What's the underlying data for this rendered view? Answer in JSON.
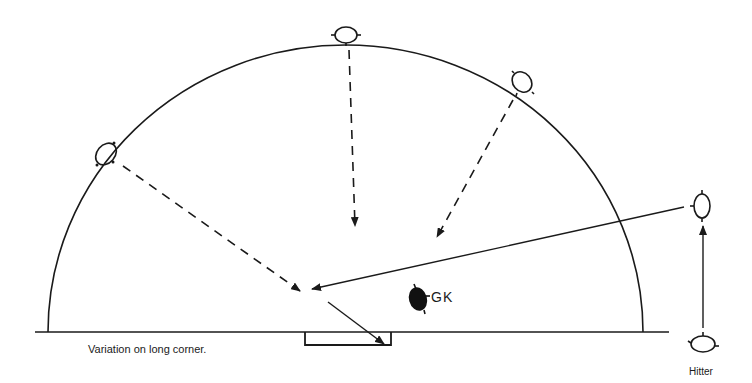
{
  "diagram": {
    "caption": "Variation on long corner.",
    "labels": {
      "goalkeeper": "GK",
      "hitter": "Hitter"
    },
    "colors": {
      "ink": "#1a1a1a",
      "background": "#ffffff",
      "goalkeeper_fill": "#111111"
    },
    "elements": {
      "shooting_circle": "semicircle arc from baseline",
      "goal": "rectangle on baseline",
      "players_open": 5,
      "players_filled": 1,
      "passes_dashed": 3,
      "passes_solid": 3
    }
  }
}
